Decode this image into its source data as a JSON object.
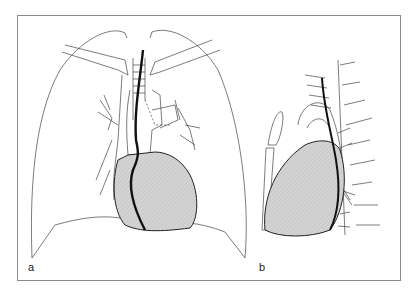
{
  "figure": {
    "panels": [
      {
        "label": "a",
        "view": "frontal",
        "description": "Frontal view of thorax showing lungs, trachea, great vessels and shaded heart with a thick dark catheter/line descending along the right heart border"
      },
      {
        "label": "b",
        "view": "lateral",
        "description": "Lateral view showing shaded heart, spine/vertebrae lines on right, sternum on left, thick dark line descending behind heart, arrows indicating position"
      }
    ],
    "colors": {
      "line": "#333333",
      "thick_line": "#111111",
      "heart_fill": "#cfcfcf",
      "frame": "#8a8a8a",
      "background": "#ffffff"
    }
  }
}
